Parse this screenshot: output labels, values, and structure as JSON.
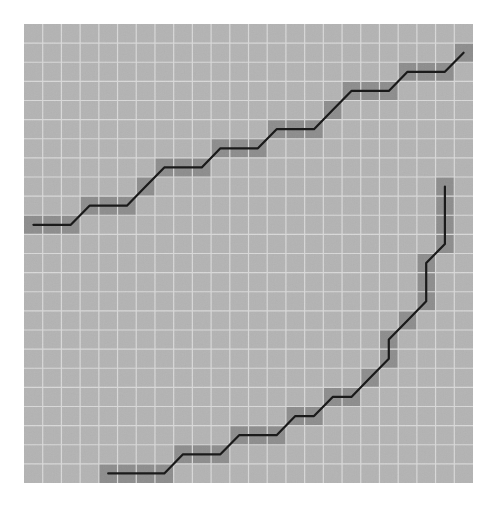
{
  "grid": {
    "columns": 24,
    "rows": 24,
    "origin_x": 24,
    "origin_y": 24,
    "width": 449,
    "height": 459,
    "colors": {
      "cell_fill": "#b3b3b3",
      "grid_line": "#d9d9d9",
      "path_cell_fill": "#8c8c8c",
      "path_line": "#1a1a1a",
      "background": "#ffffff"
    }
  },
  "paths": [
    {
      "name": "upper-staircase-path",
      "cells": [
        [
          0,
          10
        ],
        [
          1,
          10
        ],
        [
          2,
          10
        ],
        [
          3,
          9
        ],
        [
          4,
          9
        ],
        [
          5,
          9
        ],
        [
          6,
          8
        ],
        [
          7,
          7
        ],
        [
          8,
          7
        ],
        [
          9,
          7
        ],
        [
          10,
          6
        ],
        [
          11,
          6
        ],
        [
          12,
          6
        ],
        [
          13,
          5
        ],
        [
          14,
          5
        ],
        [
          15,
          5
        ],
        [
          16,
          4
        ],
        [
          17,
          3
        ],
        [
          18,
          3
        ],
        [
          19,
          3
        ],
        [
          20,
          2
        ],
        [
          21,
          2
        ],
        [
          22,
          2
        ],
        [
          23,
          1
        ]
      ]
    },
    {
      "name": "lower-curve-path",
      "cells": [
        [
          4,
          23
        ],
        [
          5,
          23
        ],
        [
          6,
          23
        ],
        [
          7,
          23
        ],
        [
          8,
          22
        ],
        [
          9,
          22
        ],
        [
          10,
          22
        ],
        [
          11,
          21
        ],
        [
          12,
          21
        ],
        [
          13,
          21
        ],
        [
          14,
          20
        ],
        [
          15,
          20
        ],
        [
          16,
          19
        ],
        [
          17,
          19
        ],
        [
          18,
          18
        ],
        [
          19,
          17
        ],
        [
          19,
          16
        ],
        [
          20,
          15
        ],
        [
          21,
          14
        ],
        [
          21,
          13
        ],
        [
          21,
          12
        ],
        [
          22,
          11
        ],
        [
          22,
          10
        ],
        [
          22,
          9
        ],
        [
          22,
          8
        ]
      ]
    }
  ]
}
